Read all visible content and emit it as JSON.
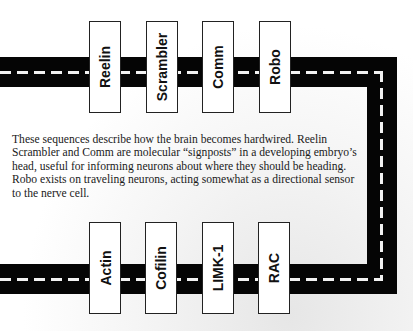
{
  "top_row": {
    "proteins": [
      "Reelin",
      "Scrambler",
      "Comm",
      "Robo"
    ]
  },
  "bottom_row": {
    "proteins": [
      "Actin",
      "Cofilin",
      "LIMK-1",
      "RAC"
    ]
  },
  "caption": "These sequences describe how the brain becomes hardwired. Reelin Scrambler and Comm are molecular “signposts” in a developing embryo’s head, useful for informing neurons about where they should be heading. Robo exists on traveling neurons, acting somewhat as a directional sensor to the nerve cell.",
  "colors": {
    "road": "#050505",
    "center_line": "#f2f2f2",
    "box_fill": "#ffffff",
    "text": "#111111"
  }
}
